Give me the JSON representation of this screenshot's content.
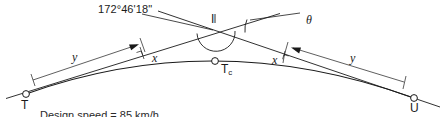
{
  "figure": {
    "type": "survey-horizontal-curve-diagram",
    "background_color": "#ffffff",
    "line_color": "#1a1a1a",
    "labels": {
      "interior_angle": "172°46'18\"",
      "deflection_angle": "θ",
      "intersection_point": "I",
      "curve_midpoint": "T",
      "curve_midpoint_subscript": "c",
      "tangent_point_left": "T",
      "tangent_point_right": "U",
      "dim_long_left": "y",
      "dim_long_right": "y",
      "dim_short_left": "x",
      "dim_short_right": "x",
      "caption_partial": "Design speed = 85 km/h"
    }
  },
  "geometry": {
    "point_T": {
      "x": 26,
      "y": 94
    },
    "point_U": {
      "x": 414,
      "y": 98
    },
    "point_I": {
      "x": 215,
      "y": 28
    },
    "point_Tc": {
      "x": 215,
      "y": 61
    },
    "tangent_left_start": {
      "x": 8,
      "y": 97
    },
    "tangent_left_end": {
      "x": 274,
      "y": 15
    },
    "tangent_right_start": {
      "x": 160,
      "y": 12
    },
    "tangent_right_end": {
      "x": 437,
      "y": 106
    },
    "curve_control": {
      "x": 215,
      "y": 28
    },
    "dim_left_from": {
      "x": 34,
      "y": 80
    },
    "dim_left_to": {
      "x": 140,
      "y": 44
    },
    "dim_right_from": {
      "x": 290,
      "y": 47
    },
    "dim_right_to": {
      "x": 405,
      "y": 81
    }
  }
}
